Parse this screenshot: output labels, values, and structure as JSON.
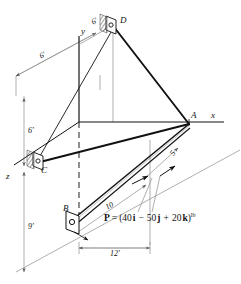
{
  "figure": {
    "type": "engineering-statics-free-body-diagram",
    "points": {
      "A": "A",
      "B": "B",
      "C": "C",
      "D": "D"
    },
    "axes": {
      "x": "x",
      "y": "y",
      "z": "z"
    },
    "dimensions": [
      {
        "id": "d-6-upper-left",
        "label": "6'"
      },
      {
        "id": "d-6-upper-right",
        "label": "6'"
      },
      {
        "id": "d-6-vertical",
        "label": "6'"
      },
      {
        "id": "d-9-vertical",
        "label": "9'"
      },
      {
        "id": "d-12-horizontal",
        "label": "12'"
      },
      {
        "id": "d-10-bar",
        "label": "10"
      },
      {
        "id": "d-5-bar",
        "label": "5"
      }
    ],
    "force": {
      "symbol": "P",
      "equals": "=",
      "open_paren": "(",
      "i_coefficient": "40",
      "i_unit": "i",
      "minus": "−",
      "j_coefficient": "50",
      "j_unit": "j",
      "plus": "+",
      "k_coefficient": "20",
      "k_unit": "k",
      "close_paren": ")",
      "units": "lb"
    },
    "colors": {
      "ink": "#111111",
      "dimension_line": "#8a8a8a",
      "background": "#ffffff"
    }
  }
}
